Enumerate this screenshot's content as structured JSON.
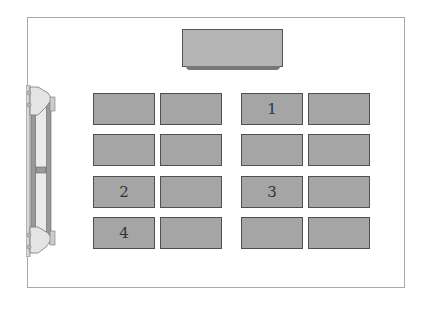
{
  "diagram": {
    "front_desk": {
      "label": ""
    },
    "desk_color": "#a5a5a5",
    "desks": [
      {
        "row": 0,
        "col": 0,
        "label": ""
      },
      {
        "row": 0,
        "col": 1,
        "label": ""
      },
      {
        "row": 0,
        "col": 2,
        "label": "1"
      },
      {
        "row": 0,
        "col": 3,
        "label": ""
      },
      {
        "row": 1,
        "col": 0,
        "label": ""
      },
      {
        "row": 1,
        "col": 1,
        "label": ""
      },
      {
        "row": 1,
        "col": 2,
        "label": ""
      },
      {
        "row": 1,
        "col": 3,
        "label": ""
      },
      {
        "row": 2,
        "col": 0,
        "label": "2"
      },
      {
        "row": 2,
        "col": 1,
        "label": ""
      },
      {
        "row": 2,
        "col": 2,
        "label": "3"
      },
      {
        "row": 2,
        "col": 3,
        "label": ""
      },
      {
        "row": 3,
        "col": 0,
        "label": "4"
      },
      {
        "row": 3,
        "col": 1,
        "label": ""
      },
      {
        "row": 3,
        "col": 2,
        "label": ""
      },
      {
        "row": 3,
        "col": 3,
        "label": ""
      }
    ],
    "door": {
      "icon": "double-door-icon"
    }
  }
}
